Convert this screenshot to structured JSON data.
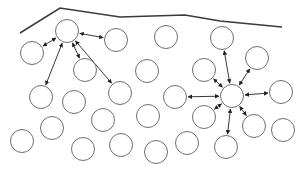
{
  "diagram": {
    "colors": {
      "stroke": "#6e6e6e",
      "fill": "#ffffff",
      "boundary": "#3a3a3a",
      "arrow": "#222222"
    },
    "node_radius": 11.5,
    "boundary": [
      [
        20,
        33
      ],
      [
        60,
        8
      ],
      [
        120,
        17
      ],
      [
        185,
        15
      ],
      [
        220,
        21
      ],
      [
        282,
        27
      ]
    ],
    "nodes": [
      {
        "id": "hub_left",
        "x": 67,
        "y": 31
      },
      {
        "id": "n1",
        "x": 32,
        "y": 53
      },
      {
        "id": "n2",
        "x": 116,
        "y": 40
      },
      {
        "id": "n3",
        "x": 85,
        "y": 70
      },
      {
        "id": "n4",
        "x": 120,
        "y": 93
      },
      {
        "id": "n5",
        "x": 41,
        "y": 97
      },
      {
        "id": "n6",
        "x": 74,
        "y": 102
      },
      {
        "id": "n7",
        "x": 166,
        "y": 37
      },
      {
        "id": "n8",
        "x": 147,
        "y": 71
      },
      {
        "id": "n9",
        "x": 22,
        "y": 141
      },
      {
        "id": "n10",
        "x": 52,
        "y": 128
      },
      {
        "id": "n11",
        "x": 103,
        "y": 120
      },
      {
        "id": "n12",
        "x": 83,
        "y": 149
      },
      {
        "id": "n13",
        "x": 121,
        "y": 145
      },
      {
        "id": "n14",
        "x": 156,
        "y": 152
      },
      {
        "id": "n15",
        "x": 148,
        "y": 116
      },
      {
        "id": "n16",
        "x": 187,
        "y": 143
      },
      {
        "id": "n17",
        "x": 204,
        "y": 117
      },
      {
        "id": "n18",
        "x": 222,
        "y": 38
      },
      {
        "id": "n19",
        "x": 257,
        "y": 58
      },
      {
        "id": "n20",
        "x": 204,
        "y": 70
      },
      {
        "id": "hub_right",
        "x": 232,
        "y": 96
      },
      {
        "id": "n21",
        "x": 175,
        "y": 97
      },
      {
        "id": "n22",
        "x": 281,
        "y": 92
      },
      {
        "id": "n23",
        "x": 254,
        "y": 126
      },
      {
        "id": "n24",
        "x": 283,
        "y": 130
      },
      {
        "id": "n25",
        "x": 226,
        "y": 147
      }
    ],
    "edges": [
      [
        "hub_left",
        "n1"
      ],
      [
        "hub_left",
        "n2"
      ],
      [
        "hub_left",
        "n3"
      ],
      [
        "hub_left",
        "n4"
      ],
      [
        "hub_left",
        "n5"
      ],
      [
        "hub_right",
        "n18"
      ],
      [
        "hub_right",
        "n19"
      ],
      [
        "hub_right",
        "n20"
      ],
      [
        "hub_right",
        "n21"
      ],
      [
        "hub_right",
        "n22"
      ],
      [
        "hub_right",
        "n23"
      ],
      [
        "hub_right",
        "n25"
      ],
      [
        "hub_right",
        "n17"
      ]
    ]
  }
}
